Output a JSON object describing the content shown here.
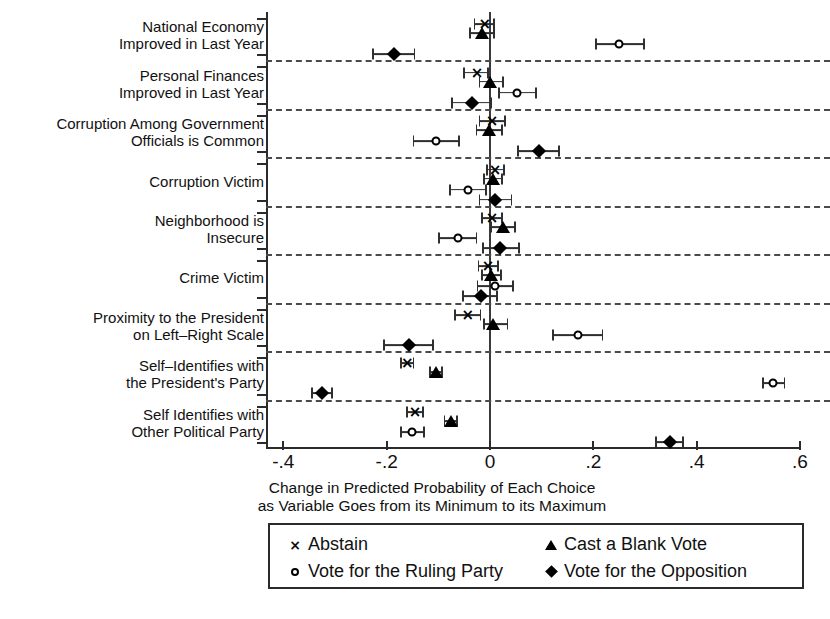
{
  "chart_data": {
    "type": "scatter",
    "title": "",
    "xlabel": "Change in Predicted Probability of Each Choice as Variable Goes from its Minimum to its Maximum",
    "xlabel_line1": "Change in Predicted Probability of Each Choice",
    "xlabel_line2": "as Variable Goes from its Minimum to its Maximum",
    "ylabel": "",
    "xlim": [
      -0.45,
      0.62
    ],
    "xticks": [
      -0.4,
      -0.2,
      0,
      0.2,
      0.4,
      0.6
    ],
    "xticklabels": [
      "-.4",
      "-.2",
      "0",
      ".2",
      ".4",
      ".6"
    ],
    "grid": "dashed horizontal separators between variable groups",
    "legend_position": "below plot, boxed, two columns",
    "zero_reference_line": 0,
    "series": [
      {
        "name": "Abstain",
        "marker": "x"
      },
      {
        "name": "Cast a Blank Vote",
        "marker": "triangle"
      },
      {
        "name": "Vote for the Ruling Party",
        "marker": "circle"
      },
      {
        "name": "Vote for the Opposition",
        "marker": "diamond"
      }
    ],
    "categories": [
      "National Economy Improved in Last Year",
      "Personal Finances Improved in Last Year",
      "Corruption Among Government Officials is Common",
      "Corruption Victim",
      "Neighborhood is Insecure",
      "Crime Victim",
      "Proximity to the President on Left-Right Scale",
      "Self-Identifies with the President's Party",
      "Self Identifies with Other Political Party"
    ],
    "points": [
      {
        "category": 0,
        "series": "Abstain",
        "estimate": -0.01,
        "ci_low": -0.03,
        "ci_high": 0.008
      },
      {
        "category": 0,
        "series": "Cast a Blank Vote",
        "estimate": -0.016,
        "ci_low": -0.038,
        "ci_high": 0.008
      },
      {
        "category": 0,
        "series": "Vote for the Ruling Party",
        "estimate": 0.25,
        "ci_low": 0.205,
        "ci_high": 0.298
      },
      {
        "category": 0,
        "series": "Vote for the Opposition",
        "estimate": -0.186,
        "ci_low": -0.226,
        "ci_high": -0.146
      },
      {
        "category": 1,
        "series": "Abstain",
        "estimate": -0.025,
        "ci_low": -0.05,
        "ci_high": -0.004
      },
      {
        "category": 1,
        "series": "Cast a Blank Vote",
        "estimate": 0.0,
        "ci_low": -0.02,
        "ci_high": 0.026
      },
      {
        "category": 1,
        "series": "Vote for the Ruling Party",
        "estimate": 0.053,
        "ci_low": 0.018,
        "ci_high": 0.09
      },
      {
        "category": 1,
        "series": "Vote for the Opposition",
        "estimate": -0.035,
        "ci_low": -0.074,
        "ci_high": 0.002
      },
      {
        "category": 2,
        "series": "Abstain",
        "estimate": 0.004,
        "ci_low": -0.02,
        "ci_high": 0.03
      },
      {
        "category": 2,
        "series": "Cast a Blank Vote",
        "estimate": -0.002,
        "ci_low": -0.026,
        "ci_high": 0.024
      },
      {
        "category": 2,
        "series": "Vote for the Ruling Party",
        "estimate": -0.104,
        "ci_low": -0.148,
        "ci_high": -0.06
      },
      {
        "category": 2,
        "series": "Vote for the Opposition",
        "estimate": 0.094,
        "ci_low": 0.054,
        "ci_high": 0.134
      },
      {
        "category": 3,
        "series": "Abstain",
        "estimate": 0.01,
        "ci_low": -0.006,
        "ci_high": 0.028
      },
      {
        "category": 3,
        "series": "Cast a Blank Vote",
        "estimate": 0.005,
        "ci_low": -0.012,
        "ci_high": 0.024
      },
      {
        "category": 3,
        "series": "Vote for the Ruling Party",
        "estimate": -0.043,
        "ci_low": -0.078,
        "ci_high": -0.008
      },
      {
        "category": 3,
        "series": "Vote for the Opposition",
        "estimate": 0.01,
        "ci_low": -0.02,
        "ci_high": 0.042
      },
      {
        "category": 4,
        "series": "Abstain",
        "estimate": 0.004,
        "ci_low": -0.016,
        "ci_high": 0.024
      },
      {
        "category": 4,
        "series": "Cast a Blank Vote",
        "estimate": 0.025,
        "ci_low": 0.002,
        "ci_high": 0.048
      },
      {
        "category": 4,
        "series": "Vote for the Ruling Party",
        "estimate": -0.062,
        "ci_low": -0.098,
        "ci_high": -0.026
      },
      {
        "category": 4,
        "series": "Vote for the Opposition",
        "estimate": 0.02,
        "ci_low": -0.014,
        "ci_high": 0.056
      },
      {
        "category": 5,
        "series": "Abstain",
        "estimate": -0.004,
        "ci_low": -0.022,
        "ci_high": 0.016
      },
      {
        "category": 5,
        "series": "Cast a Blank Vote",
        "estimate": 0.002,
        "ci_low": -0.016,
        "ci_high": 0.022
      },
      {
        "category": 5,
        "series": "Vote for the Ruling Party",
        "estimate": 0.01,
        "ci_low": -0.024,
        "ci_high": 0.044
      },
      {
        "category": 5,
        "series": "Vote for the Opposition",
        "estimate": -0.018,
        "ci_low": -0.052,
        "ci_high": 0.014
      },
      {
        "category": 6,
        "series": "Abstain",
        "estimate": -0.043,
        "ci_low": -0.068,
        "ci_high": -0.018
      },
      {
        "category": 6,
        "series": "Cast a Blank Vote",
        "estimate": 0.006,
        "ci_low": -0.012,
        "ci_high": 0.034
      },
      {
        "category": 6,
        "series": "Vote for the Ruling Party",
        "estimate": 0.17,
        "ci_low": 0.122,
        "ci_high": 0.218
      },
      {
        "category": 6,
        "series": "Vote for the Opposition",
        "estimate": -0.157,
        "ci_low": -0.205,
        "ci_high": -0.11
      },
      {
        "category": 7,
        "series": "Abstain",
        "estimate": -0.16,
        "ci_low": -0.172,
        "ci_high": -0.148
      },
      {
        "category": 7,
        "series": "Cast a Blank Vote",
        "estimate": -0.104,
        "ci_low": -0.116,
        "ci_high": -0.092
      },
      {
        "category": 7,
        "series": "Vote for the Ruling Party",
        "estimate": 0.548,
        "ci_low": 0.528,
        "ci_high": 0.57
      },
      {
        "category": 7,
        "series": "Vote for the Opposition",
        "estimate": -0.325,
        "ci_low": -0.345,
        "ci_high": -0.305
      },
      {
        "category": 8,
        "series": "Abstain",
        "estimate": -0.145,
        "ci_low": -0.16,
        "ci_high": -0.13
      },
      {
        "category": 8,
        "series": "Cast a Blank Vote",
        "estimate": -0.076,
        "ci_low": -0.088,
        "ci_high": -0.064
      },
      {
        "category": 8,
        "series": "Vote for the Ruling Party",
        "estimate": -0.15,
        "ci_low": -0.172,
        "ci_high": -0.128
      },
      {
        "category": 8,
        "series": "Vote for the Opposition",
        "estimate": 0.348,
        "ci_low": 0.322,
        "ci_high": 0.374
      }
    ]
  },
  "axis": {
    "y_labels": [
      {
        "line1": "National Economy",
        "line2": "Improved in Last Year"
      },
      {
        "line1": "Personal Finances",
        "line2": "Improved in Last Year"
      },
      {
        "line1": "Corruption Among Government",
        "line2": "Officials is Common"
      },
      {
        "line1": "Corruption Victim",
        "line2": ""
      },
      {
        "line1": "Neighborhood is",
        "line2": "Insecure"
      },
      {
        "line1": "Crime Victim",
        "line2": ""
      },
      {
        "line1": "Proximity to the President",
        "line2": "on Left–Right Scale"
      },
      {
        "line1": "Self–Identifies with",
        "line2": "the President's Party"
      },
      {
        "line1": "Self Identifies with",
        "line2": "Other Political Party"
      }
    ]
  },
  "legend": {
    "items": [
      {
        "marker": "x-marker-icon",
        "label": "Abstain"
      },
      {
        "marker": "triangle-marker-icon",
        "label": "Cast a Blank Vote"
      },
      {
        "marker": "circle-marker-icon",
        "label": "Vote for the Ruling Party"
      },
      {
        "marker": "diamond-marker-icon",
        "label": "Vote for the Opposition"
      }
    ]
  },
  "colors": {
    "marker": "#000000",
    "axis": "#2b2b2b",
    "separator": "#4a4a4a",
    "background": "#ffffff"
  }
}
